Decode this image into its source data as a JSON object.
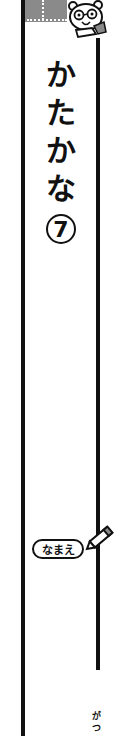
{
  "cover": {
    "title_chars": [
      "か",
      "た",
      "か",
      "な"
    ],
    "title": "かたかな",
    "volume_number": "7",
    "name_label": "なまえ",
    "month_chars": [
      "が",
      "つ"
    ]
  },
  "icons": {
    "mascot": "bear-mascot-with-glasses-pointing",
    "pencil": "pencil-icon"
  },
  "colors": {
    "line": "#111111",
    "header_band": "#8a8a8a",
    "background": "#ffffff"
  }
}
